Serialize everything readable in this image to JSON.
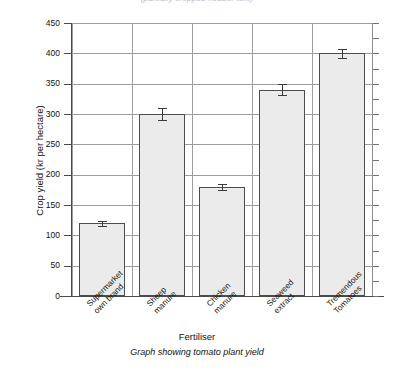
{
  "top_clipped_note": "(partially cropped header text)",
  "figure": {
    "caption": "Graph showing tomato plant yield",
    "xaxis_title": "Fertiliser",
    "yaxis_title": "Crop yield (kr per hectare)"
  },
  "chart_data": {
    "type": "bar",
    "title": "",
    "subtitle": "Graph showing tomato plant yield",
    "xlabel": "Fertiliser",
    "ylabel": "Crop yield (kr per hectare)",
    "ylim": [
      0,
      450
    ],
    "ytick_step": 50,
    "yticks": [
      0,
      50,
      100,
      150,
      200,
      250,
      300,
      350,
      400,
      450
    ],
    "grid": "both",
    "legend": "none",
    "categories": [
      "Supermarket\nown brand",
      "Sheep\nmanure",
      "Chicken\nmanure",
      "Seaweed\nextract",
      "Tremendous\nTomatoes"
    ],
    "category_lines": [
      [
        "Supermarket",
        "own brand"
      ],
      [
        "Sheep",
        "manure"
      ],
      [
        "Chicken",
        "manure"
      ],
      [
        "Seaweed",
        "extract"
      ],
      [
        "Tremendous",
        "Tomatoes"
      ]
    ],
    "values": [
      120,
      300,
      180,
      340,
      400
    ],
    "errors": [
      4,
      10,
      5,
      9,
      7
    ],
    "bar_fill": "#ebebeb",
    "bar_edge": "#4d4d4d",
    "error_color": "#3a3a3a"
  }
}
